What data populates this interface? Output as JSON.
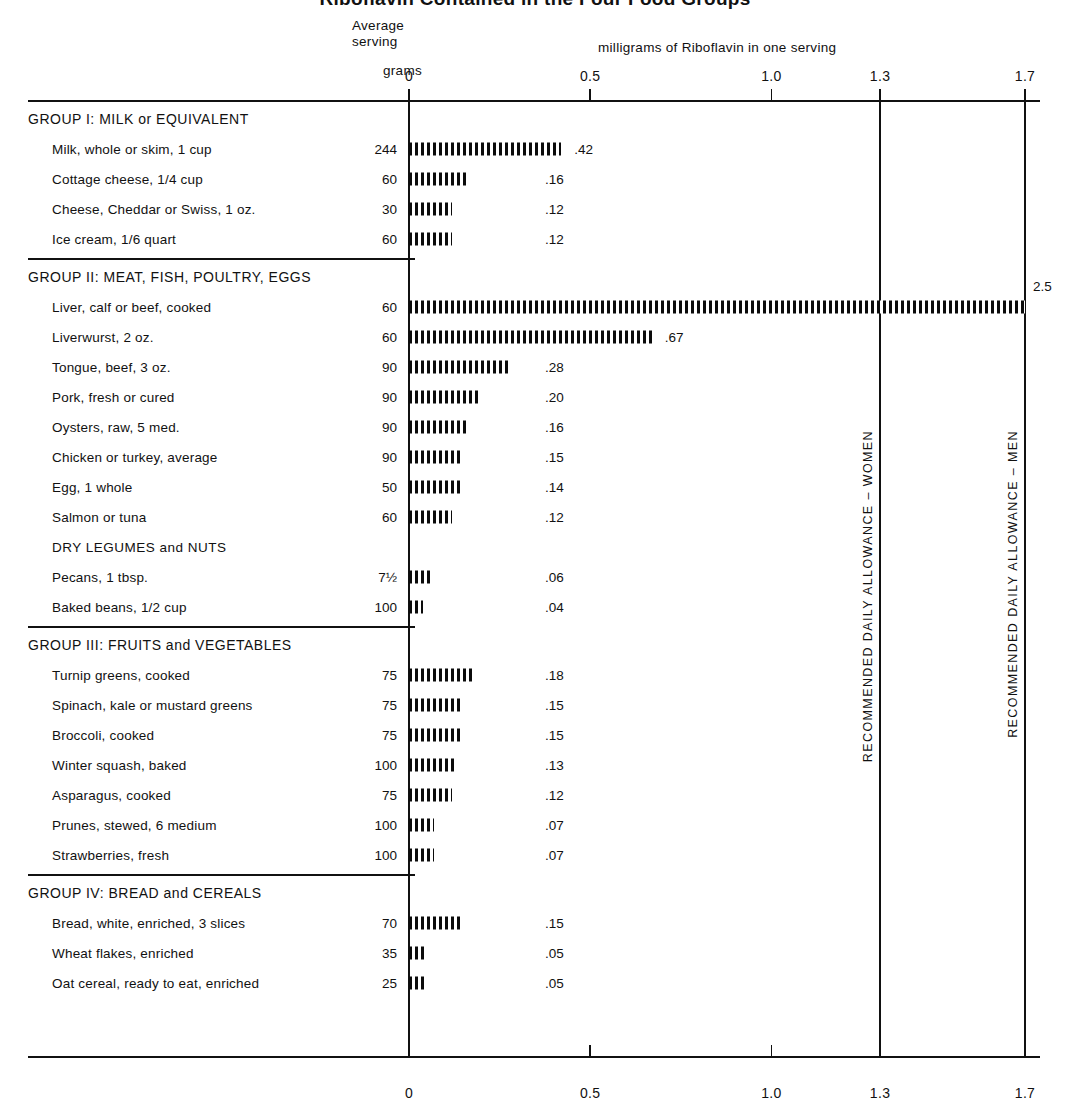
{
  "title": "Riboflavin Contained in the Four Food Groups",
  "header": {
    "average": "Average",
    "serving": "serving",
    "grams": "grams",
    "units": "milligrams of Riboflavin in one serving"
  },
  "axis": {
    "ticks": [
      "0",
      "0.5",
      "1.0",
      "1.3",
      "1.7"
    ],
    "values": [
      0,
      0.5,
      1.0,
      1.3,
      1.7
    ]
  },
  "rda": {
    "women": "RECOMMENDED DAILY ALLOWANCE – WOMEN",
    "men": "RECOMMENDED DAILY ALLOWANCE – MEN",
    "women_value": 1.3,
    "men_value": 1.7
  },
  "chart_data": {
    "type": "bar",
    "title": "Riboflavin Contained in the Four Food Groups",
    "xlabel": "milligrams of Riboflavin in one serving",
    "ylabel": "",
    "xlim": [
      0,
      1.7
    ],
    "orientation": "horizontal",
    "grid": false,
    "legend": "none",
    "xticks": [
      0,
      0.5,
      1.0,
      1.3,
      1.7
    ],
    "xticklabels": [
      "0",
      "0.5",
      "1.0",
      "1.3",
      "1.7"
    ],
    "reference_lines": [
      {
        "value": 1.3,
        "label": "RECOMMENDED DAILY ALLOWANCE – WOMEN"
      },
      {
        "value": 1.7,
        "label": "RECOMMENDED DAILY ALLOWANCE – MEN"
      }
    ],
    "groups": [
      {
        "name": "GROUP I:  MILK or EQUIVALENT",
        "items": [
          {
            "label": "Milk, whole or skim, 1 cup",
            "grams": "244",
            "value": 0.42,
            "value_label": ".42"
          },
          {
            "label": "Cottage cheese, 1/4 cup",
            "grams": "60",
            "value": 0.16,
            "value_label": ".16"
          },
          {
            "label": "Cheese, Cheddar or Swiss, 1 oz.",
            "grams": "30",
            "value": 0.12,
            "value_label": ".12"
          },
          {
            "label": "Ice cream, 1/6 quart",
            "grams": "60",
            "value": 0.12,
            "value_label": ".12"
          }
        ]
      },
      {
        "name": "GROUP II:  MEAT, FISH, POULTRY, EGGS",
        "items": [
          {
            "label": "Liver, calf or beef, cooked",
            "grams": "60",
            "value": 2.5,
            "value_label": "2.5"
          },
          {
            "label": "Liverwurst, 2 oz.",
            "grams": "60",
            "value": 0.67,
            "value_label": ".67"
          },
          {
            "label": "Tongue, beef, 3 oz.",
            "grams": "90",
            "value": 0.28,
            "value_label": ".28"
          },
          {
            "label": "Pork, fresh or cured",
            "grams": "90",
            "value": 0.2,
            "value_label": ".20"
          },
          {
            "label": "Oysters, raw, 5 med.",
            "grams": "90",
            "value": 0.16,
            "value_label": ".16"
          },
          {
            "label": "Chicken or turkey, average",
            "grams": "90",
            "value": 0.15,
            "value_label": ".15"
          },
          {
            "label": "Egg, 1 whole",
            "grams": "50",
            "value": 0.14,
            "value_label": ".14"
          },
          {
            "label": "Salmon or tuna",
            "grams": "60",
            "value": 0.12,
            "value_label": ".12"
          },
          {
            "label": "DRY LEGUMES and NUTS",
            "grams": "",
            "value": null,
            "value_label": "",
            "subheader": true
          },
          {
            "label": "Pecans, 1 tbsp.",
            "grams": "7½",
            "value": 0.06,
            "value_label": ".06"
          },
          {
            "label": "Baked beans, 1/2 cup",
            "grams": "100",
            "value": 0.04,
            "value_label": ".04"
          }
        ]
      },
      {
        "name": "GROUP III:  FRUITS and VEGETABLES",
        "items": [
          {
            "label": "Turnip greens, cooked",
            "grams": "75",
            "value": 0.18,
            "value_label": ".18"
          },
          {
            "label": "Spinach, kale or mustard greens",
            "grams": "75",
            "value": 0.15,
            "value_label": ".15"
          },
          {
            "label": "Broccoli, cooked",
            "grams": "75",
            "value": 0.15,
            "value_label": ".15"
          },
          {
            "label": "Winter squash, baked",
            "grams": "100",
            "value": 0.13,
            "value_label": ".13"
          },
          {
            "label": "Asparagus, cooked",
            "grams": "75",
            "value": 0.12,
            "value_label": ".12"
          },
          {
            "label": "Prunes, stewed, 6 medium",
            "grams": "100",
            "value": 0.07,
            "value_label": ".07"
          },
          {
            "label": "Strawberries, fresh",
            "grams": "100",
            "value": 0.07,
            "value_label": ".07"
          }
        ]
      },
      {
        "name": "GROUP IV:  BREAD and CEREALS",
        "items": [
          {
            "label": "Bread, white, enriched, 3 slices",
            "grams": "70",
            "value": 0.15,
            "value_label": ".15"
          },
          {
            "label": "Wheat flakes, enriched",
            "grams": "35",
            "value": 0.05,
            "value_label": ".05"
          },
          {
            "label": "Oat cereal, ready to eat, enriched",
            "grams": "25",
            "value": 0.05,
            "value_label": ".05"
          }
        ]
      }
    ]
  }
}
